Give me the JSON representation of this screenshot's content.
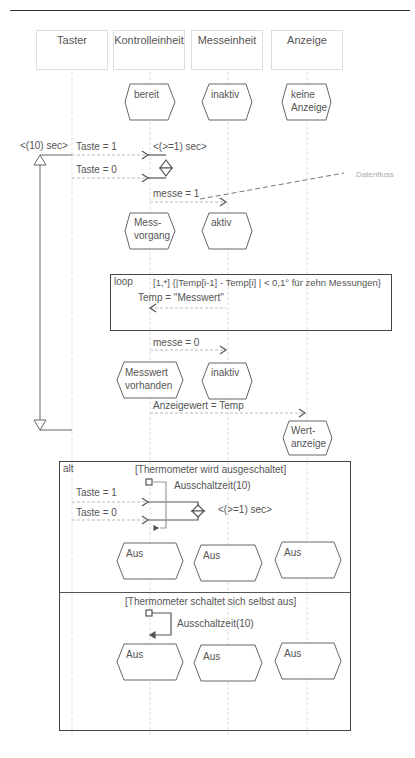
{
  "lifelines": [
    {
      "name": "Taster"
    },
    {
      "name": "Kontrolleinheit"
    },
    {
      "name": "Messeinheit"
    },
    {
      "name": "Anzeige"
    }
  ],
  "initial_states": {
    "kontrolleinheit": "bereit",
    "messeinheit": "inaktiv",
    "anzeige_line1": "keine",
    "anzeige_line2": "Anzeige"
  },
  "timing": {
    "outer": "<(10) sec>",
    "inner": "<(>=1) sec>"
  },
  "messages": {
    "taste1": "Taste = 1",
    "taste0": "Taste = 0",
    "messe1": "messe = 1",
    "messe0": "messe = 0",
    "anzeigewert": "Anzeigewert = Temp",
    "temp": "Temp = \"Messwert\""
  },
  "annotation": "Datenfluss",
  "states_mid": {
    "messvorgang_1": "Mess-",
    "messvorgang_2": "vorgang",
    "aktiv": "aktiv",
    "messwert_1": "Messwert",
    "messwert_2": "vorhanden",
    "inaktiv": "inaktiv",
    "wert_1": "Wert-",
    "wert_2": "anzeige"
  },
  "loop": {
    "tag": "loop",
    "guard": "[1,*] {|Temp[i-1] - Temp[i] | < 0,1° für zehn Messungen}"
  },
  "alt": {
    "tag": "alt",
    "guard1": "[Thermometer wird ausgeschaltet]",
    "guard2": "[Thermometer schaltet sich selbst aus]",
    "timer": "Ausschaltzeit(10)",
    "taste1": "Taste = 1",
    "taste0": "Taste = 0",
    "timing": "<(>=1) sec>",
    "state": "Aus"
  }
}
